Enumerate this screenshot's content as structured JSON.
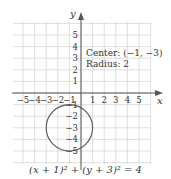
{
  "chart_data": {
    "type": "circle-graph",
    "title": "",
    "xlabel": "x",
    "ylabel": "y",
    "x_ticks": [
      "-5",
      "-4",
      "-3",
      "-2",
      "-1",
      "1",
      "2",
      "3",
      "4",
      "5"
    ],
    "y_ticks": [
      "5",
      "4",
      "3",
      "2",
      "1",
      "-1",
      "-2",
      "-3",
      "-4",
      "-5"
    ],
    "xlim": [
      -6,
      6
    ],
    "ylim": [
      -6,
      6
    ],
    "grid": true,
    "circle": {
      "center": [
        -1,
        -3
      ],
      "radius": 2
    },
    "annotations": [
      "Center: (−1, −3)",
      "Radius: 2"
    ],
    "equation": "(x + 1)² + (y + 3)² = 4"
  },
  "labels": {
    "x_axis": "x",
    "y_axis": "y",
    "center": "Center: (−1, −3)",
    "radius": "Radius: 2",
    "equation": "(x + 1)² + (y + 3)² = 4"
  }
}
